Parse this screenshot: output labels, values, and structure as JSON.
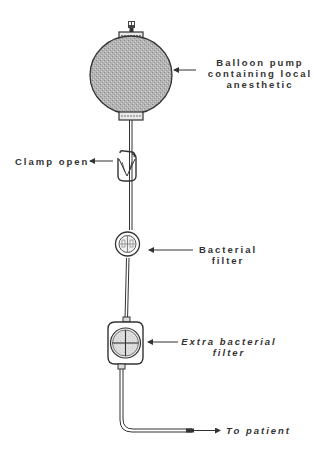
{
  "diagram": {
    "colors": {
      "background": "#ffffff",
      "ink": "#333333",
      "balloon_fill": "#b0b0b0"
    },
    "components": [
      {
        "id": "balloon",
        "name": "Balloon pump"
      },
      {
        "id": "clamp",
        "name": "Clamp"
      },
      {
        "id": "bacterial-filter",
        "name": "Bacterial filter"
      },
      {
        "id": "extra-bacterial-filter",
        "name": "Extra bacterial filter"
      },
      {
        "id": "tubing",
        "name": "Tubing to patient"
      }
    ],
    "labels": {
      "balloon_line1": "Balloon pump",
      "balloon_line2": "containing local",
      "balloon_line3": "anesthetic",
      "clamp": "Clamp open",
      "filter_line1": "Bacterial",
      "filter_line2": "filter",
      "extra_filter_line1": "Extra bacterial",
      "extra_filter_line2": "filter",
      "patient": "To patient"
    }
  }
}
